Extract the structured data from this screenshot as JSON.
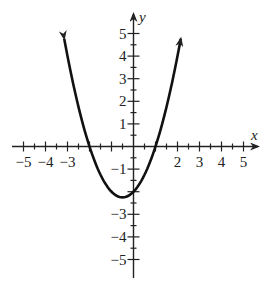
{
  "chart_data": {
    "type": "line",
    "title": "",
    "xlabel": "x",
    "ylabel": "y",
    "xlim": [
      -5,
      5
    ],
    "ylim": [
      -5,
      5
    ],
    "grid": false,
    "x_tick_labels": [
      "-5",
      "-4",
      "-3",
      "2",
      "3",
      "4",
      "5"
    ],
    "x_tick_values": [
      -5,
      -4,
      -3,
      2,
      3,
      4,
      5
    ],
    "y_tick_labels": [
      "5",
      "4",
      "3",
      "2",
      "1",
      "-1",
      "-3",
      "-4",
      "-5"
    ],
    "y_tick_values": [
      5,
      4,
      3,
      2,
      1,
      -1,
      -3,
      -4,
      -5
    ],
    "minor_tick_step": 0.5,
    "series": [
      {
        "name": "y = x^2 + x - 2",
        "equation": "y = x^2 + x - 2",
        "x_range": [
          -3.15,
          2.15
        ],
        "vertex": [
          -0.5,
          -2.25
        ],
        "y_intercept": -2,
        "x_intercepts": [
          -2,
          1
        ],
        "arrows_at_ends": true,
        "color": "#111111"
      }
    ]
  },
  "labels": {
    "x_axis": "x",
    "y_axis": "y"
  },
  "colors": {
    "axis": "#222222",
    "curve": "#111111",
    "background": "#ffffff"
  }
}
